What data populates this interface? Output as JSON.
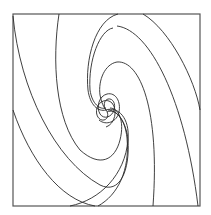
{
  "figure": {
    "type": "spiral-streamline-diagram",
    "frame": {
      "x": 13,
      "y": 14,
      "width": 187,
      "height": 192,
      "stroke": "#555555"
    },
    "center": {
      "x": 106,
      "y": 110
    },
    "line_color": "#2a2a2a",
    "arms": 2
  }
}
